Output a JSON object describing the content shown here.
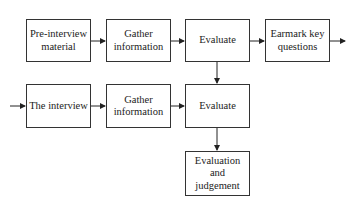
{
  "diagram": {
    "type": "flowchart",
    "nodes": [
      {
        "id": "pre",
        "label": "Pre-interview material"
      },
      {
        "id": "gather1",
        "label": "Gather information"
      },
      {
        "id": "eval1",
        "label": "Evaluate"
      },
      {
        "id": "earmark",
        "label": "Earmark key questions"
      },
      {
        "id": "interview",
        "label": "The interview"
      },
      {
        "id": "gather2",
        "label": "Gather information"
      },
      {
        "id": "eval2",
        "label": "Evaluate"
      },
      {
        "id": "judgement",
        "label": "Evaluation and judgement"
      }
    ],
    "edges": [
      {
        "from": "pre",
        "to": "gather1"
      },
      {
        "from": "gather1",
        "to": "eval1"
      },
      {
        "from": "eval1",
        "to": "earmark"
      },
      {
        "from": "earmark",
        "to": "(out)"
      },
      {
        "from": "eval1",
        "to": "eval2"
      },
      {
        "from": "(in)",
        "to": "interview"
      },
      {
        "from": "interview",
        "to": "gather2"
      },
      {
        "from": "gather2",
        "to": "eval2"
      },
      {
        "from": "eval2",
        "to": "judgement"
      }
    ]
  }
}
